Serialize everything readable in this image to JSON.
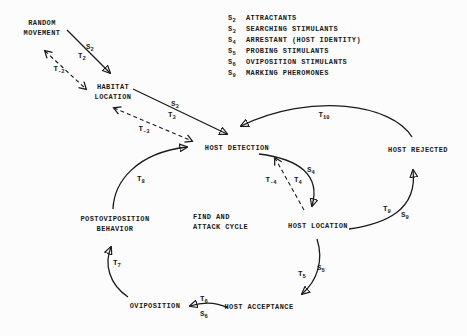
{
  "diagram": {
    "colors": {
      "ink": "#1b1b1b",
      "paper": "#fcfcfc"
    },
    "legend": {
      "items": [
        {
          "sym": "S",
          "sub": "2",
          "text": "ATTRACTANTS"
        },
        {
          "sym": "S",
          "sub": "3",
          "text": "SEARCHING STIMULANTS"
        },
        {
          "sym": "S",
          "sub": "4",
          "text": "ARRESTANT (HOST IDENTITY)"
        },
        {
          "sym": "S",
          "sub": "5",
          "text": "PROBING STIMULANTS"
        },
        {
          "sym": "S",
          "sub": "6",
          "text": "OVIPOSITION STIMULANTS"
        },
        {
          "sym": "S",
          "sub": "9",
          "text": "MARKING PHEROMONES"
        }
      ]
    },
    "nodes": {
      "random_movement": {
        "line1": "RANDOM",
        "line2": "MOVEMENT"
      },
      "habitat_location": {
        "line1": "HABITAT",
        "line2": "LOCATION"
      },
      "host_detection": {
        "label": "HOST DETECTION"
      },
      "host_rejected": {
        "label": "HOST REJECTED"
      },
      "host_location": {
        "label": "HOST LOCATION"
      },
      "postoviposition_behavior": {
        "line1": "POSTOVIPOSITION",
        "line2": "BEHAVIOR"
      },
      "find_attack_cycle": {
        "line1": "FIND AND",
        "line2": "ATTACK CYCLE"
      },
      "oviposition": {
        "label": "OVIPOSITION"
      },
      "host_acceptance": {
        "label": "HOST ACCEPTANCE"
      }
    },
    "edge_labels": {
      "s2": {
        "main": "S",
        "sub": "2"
      },
      "t2": {
        "main": "T",
        "sub": "2"
      },
      "tm2": {
        "main": "T",
        "sub": "-2"
      },
      "s3": {
        "main": "S",
        "sub": "3"
      },
      "t3": {
        "main": "T",
        "sub": "3"
      },
      "tm3": {
        "main": "T",
        "sub": "-3"
      },
      "t8": {
        "main": "T",
        "sub": "8"
      },
      "t10": {
        "main": "T",
        "sub": "10"
      },
      "tm4": {
        "main": "T",
        "sub": "-4"
      },
      "t4": {
        "main": "T",
        "sub": "4"
      },
      "s4": {
        "main": "S",
        "sub": "4"
      },
      "t9": {
        "main": "T",
        "sub": "9"
      },
      "s9": {
        "main": "S",
        "sub": "9"
      },
      "t5": {
        "main": "T",
        "sub": "5"
      },
      "s5": {
        "main": "S",
        "sub": "5"
      },
      "t6": {
        "main": "T",
        "sub": "6"
      },
      "s6": {
        "main": "S",
        "sub": "6"
      },
      "t7": {
        "main": "T",
        "sub": "7"
      }
    }
  }
}
